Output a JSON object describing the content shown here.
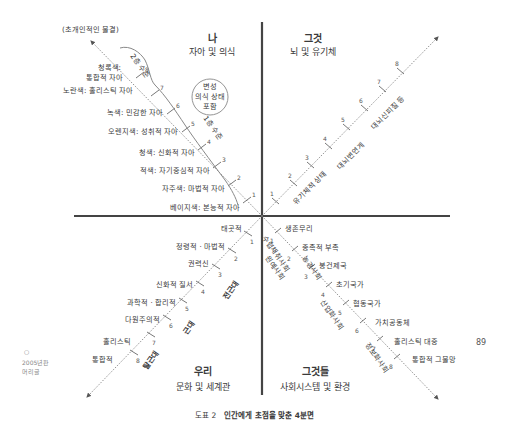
{
  "quadrants": {
    "upper_left": {
      "title": "나",
      "subtitle": "자아 및 의식"
    },
    "upper_right": {
      "title": "그것",
      "subtitle": "뇌 및 유기체"
    },
    "lower_left": {
      "title": "우리",
      "subtitle": "문화 및 세계관"
    },
    "lower_right": {
      "title": "그것들",
      "subtitle": "사회시스템 및 환경"
    }
  },
  "top_note": "(초개인적인 물결)",
  "circle_note": [
    "변성",
    "의식 상태",
    "포함"
  ],
  "tiers": {
    "second": "2층 수준",
    "first": "1층 수준"
  },
  "upper_left_levels": [
    {
      "n": "1",
      "label": "베이지색: 본능적 자아"
    },
    {
      "n": "2",
      "label": "자주색: 마법적 자아"
    },
    {
      "n": "3",
      "label": "적색: 자기중심적 자아"
    },
    {
      "n": "4",
      "label": "청색: 신화적 자아"
    },
    {
      "n": "5",
      "label": "오렌지색: 성취적 자아"
    },
    {
      "n": "6",
      "label": "녹색: 민감한 자아"
    },
    {
      "n": "7",
      "label": "노란색: 홀리스틱 자아"
    },
    {
      "n": "8",
      "label": [
        "청록색:",
        "통합적 자아"
      ]
    }
  ],
  "upper_right_levels": [
    "1",
    "2",
    "3",
    "4",
    "5",
    "6",
    "7",
    "8"
  ],
  "upper_right_labels": [
    "유기체적 상태",
    "대뇌변연계",
    "대뇌신피질 등"
  ],
  "lower_left_levels": [
    {
      "n": "1",
      "label": "태곳적"
    },
    {
      "n": "2",
      "label": "정령적 · 마법적"
    },
    {
      "n": "3",
      "label": "권력신"
    },
    {
      "n": "4",
      "label": "신화적 질서"
    },
    {
      "n": "5",
      "label": "과학적 · 합리적"
    },
    {
      "n": "6",
      "label": "다원주의적"
    },
    {
      "n": "7",
      "label": "홀리스틱"
    },
    {
      "n": "8",
      "label": "통합적"
    }
  ],
  "lower_left_eras": [
    "전근대",
    "근대",
    "탈근대"
  ],
  "lower_right_levels": [
    {
      "n": "1",
      "label": "생존무리"
    },
    {
      "n": "2",
      "label": "종족적 부족"
    },
    {
      "n": "3",
      "label": "봉건제국"
    },
    {
      "n": "4",
      "label": "초기국가"
    },
    {
      "n": "5",
      "label": "협동국가"
    },
    {
      "n": "6",
      "label": "가치공동체"
    },
    {
      "n": "7",
      "label": "홀리스틱 대중"
    },
    {
      "n": "8",
      "label": "통합적 그물망"
    }
  ],
  "lower_right_societies": [
    "수렵채취사회",
    "원예사회",
    "농경사회",
    "산업화사회",
    "정보화사회"
  ],
  "side_note": {
    "mark": "○",
    "lines": [
      "2005년판",
      "머리글"
    ]
  },
  "page_number": "89",
  "caption": {
    "prefix": "도표 2",
    "title": "인간에게 초점을 맞춘 4분면"
  }
}
